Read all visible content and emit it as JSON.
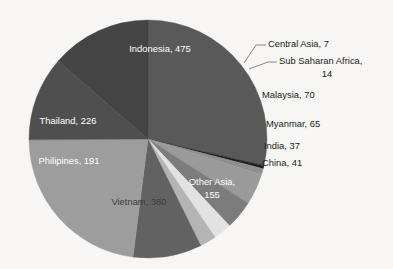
{
  "chart_data": {
    "type": "pie",
    "title": "",
    "subtitle": "",
    "xlabel": "",
    "ylabel": "",
    "legend_position": "none",
    "grid": false,
    "label_format": "name, value",
    "total": 1657,
    "categories": [
      "Indonesia",
      "Central Asia",
      "Sub Saharan Africa",
      "Malaysia",
      "Myanmar",
      "China",
      "India",
      "Other Asia",
      "Vietnam",
      "Philipines",
      "Thailand"
    ],
    "values": [
      475,
      7,
      14,
      70,
      65,
      41,
      37,
      155,
      380,
      191,
      226
    ],
    "colors": [
      "#595959",
      "#1f1f1f",
      "#8f8f8f",
      "#9a9a9a",
      "#7c7c7c",
      "#e2e2e2",
      "#b4b4b4",
      "#626262",
      "#9d9d9d",
      "#4f4f4f",
      "#444444"
    ],
    "slices": [
      {
        "name": "Indonesia",
        "value": 475,
        "label": "Indonesia, 475",
        "color": "#595959",
        "label_placement": "inside",
        "label_color": "light"
      },
      {
        "name": "Central Asia",
        "value": 7,
        "label": "Central Asia, 7",
        "color": "#1f1f1f",
        "label_placement": "callout",
        "label_color": "dark"
      },
      {
        "name": "Sub Saharan Africa",
        "value": 14,
        "label_line1": "Sub Saharan Africa,",
        "label_line2": "14",
        "color": "#8f8f8f",
        "label_placement": "callout",
        "label_color": "dark"
      },
      {
        "name": "Malaysia",
        "value": 70,
        "label": "Malaysia, 70",
        "color": "#9a9a9a",
        "label_placement": "outside",
        "label_color": "dark"
      },
      {
        "name": "Myanmar",
        "value": 65,
        "label": "Myanmar, 65",
        "color": "#7c7c7c",
        "label_placement": "outside",
        "label_color": "dark"
      },
      {
        "name": "China",
        "value": 41,
        "label": "China, 41",
        "color": "#e2e2e2",
        "label_placement": "outside",
        "label_color": "dark"
      },
      {
        "name": "India",
        "value": 37,
        "label": "India, 37",
        "color": "#b4b4b4",
        "label_placement": "outside",
        "label_color": "dark"
      },
      {
        "name": "Other Asia",
        "value": 155,
        "label_line1": "Other Asia,",
        "label_line2": "155",
        "color": "#626262",
        "label_placement": "inside",
        "label_color": "light"
      },
      {
        "name": "Vietnam",
        "value": 380,
        "label": "Vietnam, 380",
        "color": "#9d9d9d",
        "label_placement": "inside",
        "label_color": "dark"
      },
      {
        "name": "Philipines",
        "value": 191,
        "label": "Philipines, 191",
        "color": "#4f4f4f",
        "label_placement": "inside",
        "label_color": "light"
      },
      {
        "name": "Thailand",
        "value": 226,
        "label": "Thailand, 226",
        "color": "#444444",
        "label_placement": "inside",
        "label_color": "light"
      }
    ]
  },
  "labels": {
    "indonesia": "Indonesia, 475",
    "central_asia": "Central Asia, 7",
    "sub_saharan_africa_line1": "Sub Saharan Africa,",
    "sub_saharan_africa_line2": "14",
    "malaysia": "Malaysia, 70",
    "myanmar": "Myanmar, 65",
    "india": "India, 37",
    "china": "China, 41",
    "other_asia_line1": "Other Asia,",
    "other_asia_line2": "155",
    "vietnam": "Vietnam, 380",
    "philipines": "Philipines, 191",
    "thailand": "Thailand, 226"
  },
  "style": {
    "background": "#f7f6f4",
    "label_light": "#ffffff",
    "label_dark": "#1b1b1b",
    "leader_color": "#6f6f6f"
  }
}
